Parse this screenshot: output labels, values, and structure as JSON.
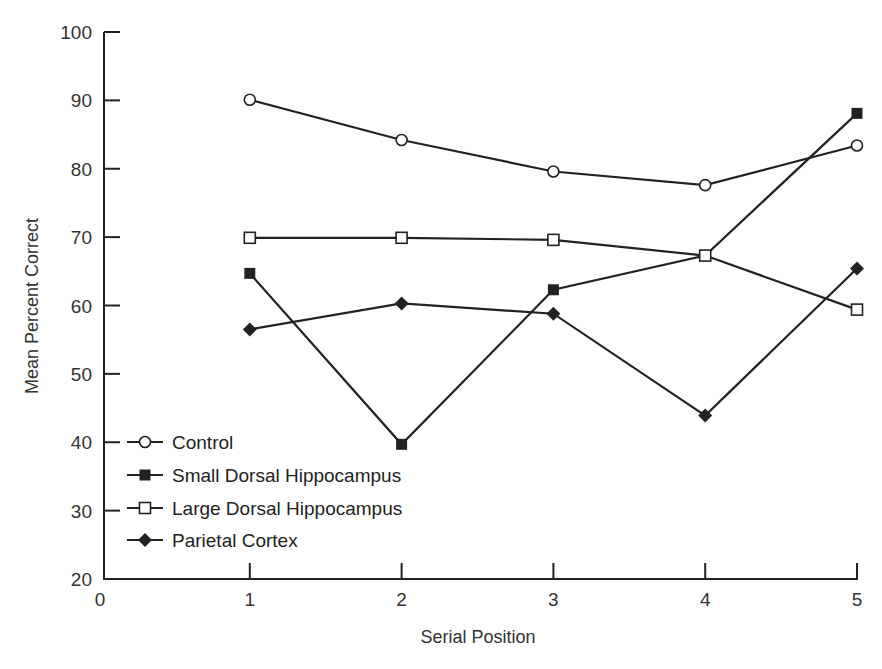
{
  "chart_data": {
    "type": "line",
    "title": "",
    "xlabel": "Serial Position",
    "ylabel": "Mean Percent Correct",
    "x": [
      1,
      2,
      3,
      4,
      5
    ],
    "x_ticks": [
      "0",
      "1",
      "2",
      "3",
      "4",
      "5"
    ],
    "y_ticks": [
      "20",
      "30",
      "40",
      "50",
      "60",
      "70",
      "80",
      "90",
      "100"
    ],
    "xlim": [
      0,
      5
    ],
    "ylim": [
      20,
      100
    ],
    "grid": false,
    "legend_position": "lower left",
    "series": [
      {
        "name": "Control",
        "marker": "open-circle",
        "values": [
          90.1,
          84.2,
          79.6,
          77.6,
          83.4
        ]
      },
      {
        "name": "Small Dorsal Hippocampus",
        "marker": "filled-square",
        "values": [
          64.7,
          39.7,
          62.3,
          67.3,
          88.1
        ]
      },
      {
        "name": "Large Dorsal Hippocampus",
        "marker": "open-square",
        "values": [
          69.9,
          69.9,
          69.6,
          67.3,
          59.4
        ]
      },
      {
        "name": "Parietal Cortex",
        "marker": "filled-diamond",
        "values": [
          56.5,
          60.3,
          58.8,
          43.9,
          65.4
        ]
      }
    ]
  },
  "colors": {
    "ink": "#222222",
    "background": "#ffffff"
  }
}
